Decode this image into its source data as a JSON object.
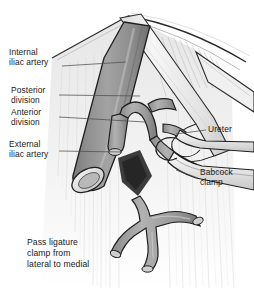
{
  "figure": {
    "style": "grayscale medical line drawing"
  },
  "labels": {
    "internal_iliac_artery": "Internal\niliac artery",
    "posterior_division": "Posterior\ndivision",
    "anterior_division": "Anterior\ndivision",
    "external_iliac_artery": "External\niliac artery",
    "ureter": "Ureter",
    "babcock_clamp": "Babcock\nclamp"
  },
  "caption": "Pass ligature\nclamp from\nlateral to medial",
  "colors": {
    "background": "#ffffff",
    "outline": "#1a1a1a",
    "artery_mid": "#9a9a9a",
    "artery_dark": "#7d7d7d",
    "artery_light": "#c4c4c4",
    "vessel_fill": "#a9a9a9",
    "ureter_pale": "#efefef",
    "tissue_faint": "#dcdcdc",
    "shadow_dark": "#3a3a3a",
    "instrument": "#e8e8e8",
    "text": "#1a1a1a",
    "leader_line": "#5a5a5a"
  }
}
